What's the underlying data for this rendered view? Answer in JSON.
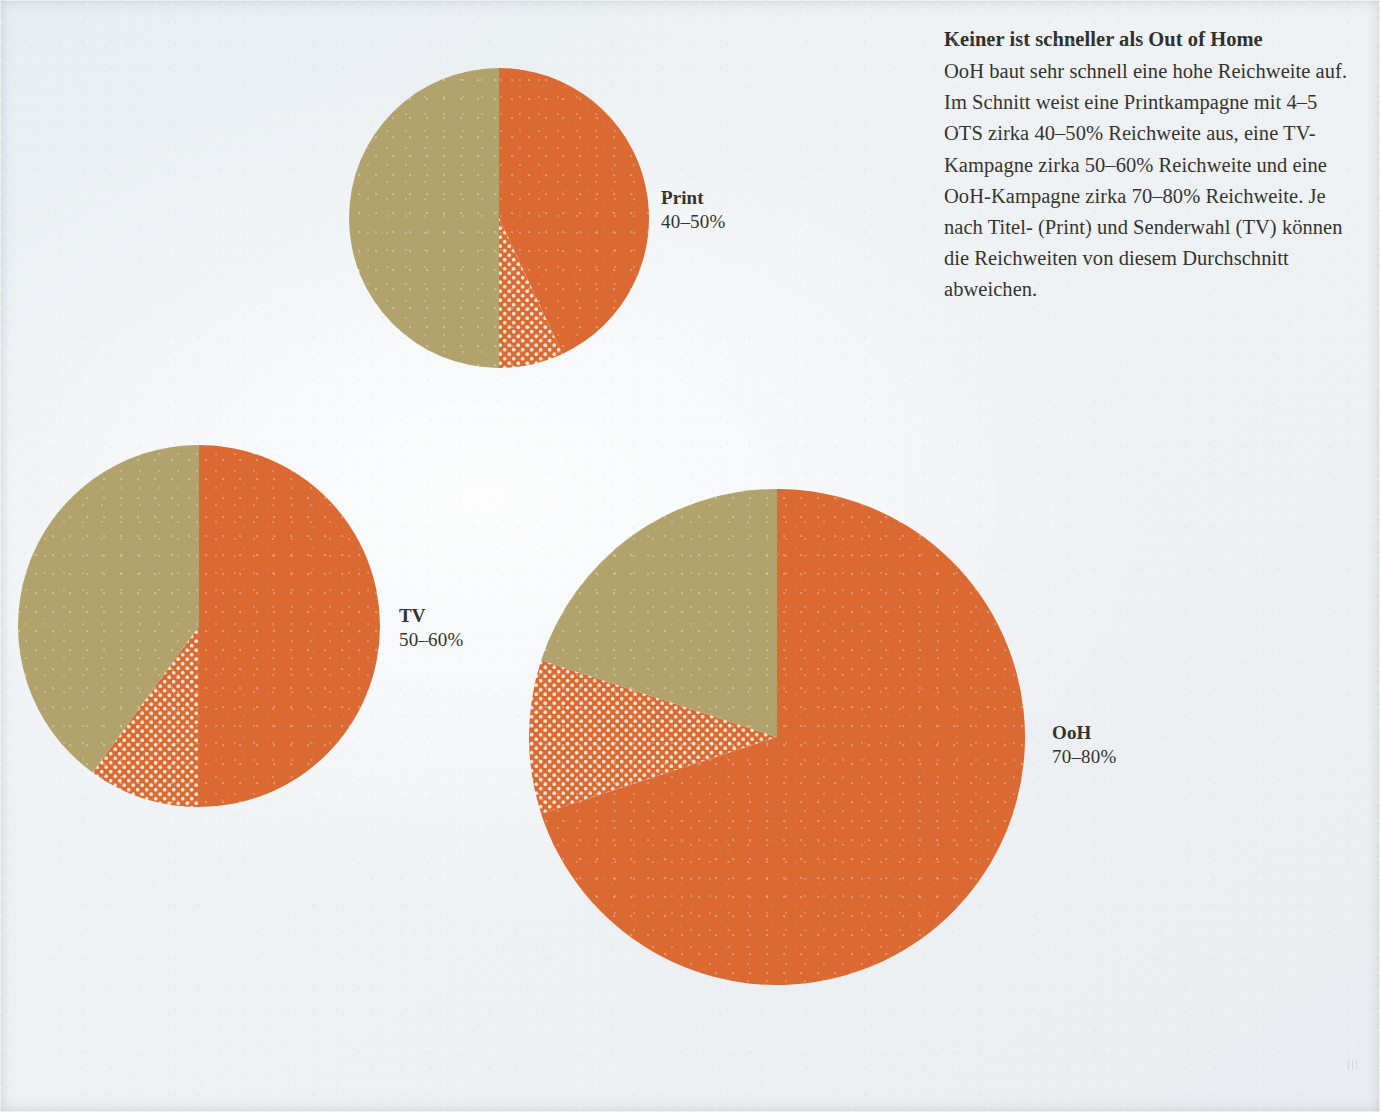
{
  "page": {
    "background_color": "#edf1f4",
    "orange_color": "#df6c33",
    "olive_color": "#b5a66e",
    "text_color": "#32322f"
  },
  "copy": {
    "heading": "Keiner ist schneller als Out of Home",
    "body": "OoH baut sehr schnell eine hohe Reichweite auf. Im Schnitt weist eine Printkampagne mit 4–5 OTS zirka 40–50% Reichweite aus, eine TV-Kampagne zirka 50–60% Reichweite und eine OoH-Kampagne zirka 70–80% Reichweite. Je nach Titel- (Print) und Senderwahl (TV) können die Reichweiten von diesem Durchschnitt abweichen."
  },
  "labels": {
    "print": {
      "name": "Print",
      "value": "40–50%"
    },
    "tv": {
      "name": "TV",
      "value": "50–60%"
    },
    "ooh": {
      "name": "OoH",
      "value": "70–80%"
    }
  },
  "chart_data": {
    "type": "pie",
    "title": "Keiner ist schneller als Out of Home",
    "subtitle": "Reichweitenaufbau nach Mediengattung",
    "unit": "% Reichweite",
    "legend": [
      {
        "key": "reach_solid",
        "label": "Reichweite (Untergrenze)",
        "color": "#df6c33",
        "fill": "solid"
      },
      {
        "key": "reach_range",
        "label": "Reichweiten-Spanne (Obergrenze)",
        "color": "#df6c33",
        "fill": "dotted"
      },
      {
        "key": "remainder",
        "label": "Nicht erreicht",
        "color": "#b5a66e",
        "fill": "solid"
      }
    ],
    "charts": [
      {
        "id": "print",
        "name": "Print",
        "value_label": "40–50%",
        "reach_min": 40,
        "reach_max": 50,
        "radius_px": 150,
        "center_px": [
          499,
          218
        ],
        "slices": [
          {
            "key": "reach_solid",
            "percent": 43,
            "start_deg": 0,
            "end_deg": 155,
            "color": "#df6c33",
            "fill": "solid"
          },
          {
            "key": "reach_range",
            "percent": 7,
            "start_deg": 155,
            "end_deg": 180,
            "color": "#df6c33",
            "fill": "dotted"
          },
          {
            "key": "remainder",
            "percent": 50,
            "start_deg": 180,
            "end_deg": 360,
            "color": "#b5a66e",
            "fill": "solid"
          }
        ]
      },
      {
        "id": "tv",
        "name": "TV",
        "value_label": "50–60%",
        "reach_min": 50,
        "reach_max": 60,
        "radius_px": 181,
        "center_px": [
          199,
          626
        ],
        "slices": [
          {
            "key": "reach_solid",
            "percent": 50,
            "start_deg": 0,
            "end_deg": 180,
            "color": "#df6c33",
            "fill": "solid"
          },
          {
            "key": "reach_range",
            "percent": 10,
            "start_deg": 180,
            "end_deg": 216,
            "color": "#df6c33",
            "fill": "dotted"
          },
          {
            "key": "remainder",
            "percent": 40,
            "start_deg": 216,
            "end_deg": 360,
            "color": "#b5a66e",
            "fill": "solid"
          }
        ]
      },
      {
        "id": "ooh",
        "name": "OoH",
        "value_label": "70–80%",
        "reach_min": 70,
        "reach_max": 80,
        "radius_px": 248,
        "center_px": [
          777,
          737
        ],
        "slices": [
          {
            "key": "reach_solid",
            "percent": 70,
            "start_deg": 0,
            "end_deg": 252,
            "color": "#df6c33",
            "fill": "solid"
          },
          {
            "key": "reach_range",
            "percent": 10,
            "start_deg": 252,
            "end_deg": 288,
            "color": "#df6c33",
            "fill": "dotted"
          },
          {
            "key": "remainder",
            "percent": 20,
            "start_deg": 288,
            "end_deg": 360,
            "color": "#b5a66e",
            "fill": "solid"
          }
        ]
      }
    ]
  }
}
